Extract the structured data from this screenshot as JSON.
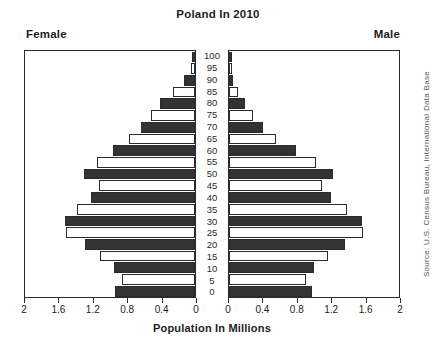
{
  "chart_data": {
    "type": "bar",
    "title": "Poland In 2010",
    "subtitle": "",
    "xlabel": "Population In Millions",
    "ylabel": "",
    "left_panel_label": "Female",
    "right_panel_label": "Male",
    "source": "Source: U.S. Census Bureau, International Data Base",
    "grid": false,
    "legend": "none",
    "xlim_left": [
      2,
      0
    ],
    "xlim_right": [
      0,
      2
    ],
    "xticks_left": [
      "2",
      "1.6",
      "1.2",
      "0.8",
      "0.4",
      "0"
    ],
    "xticks_right": [
      "0",
      "0.4",
      "0.8",
      "1.2",
      "1.6",
      "2"
    ],
    "xtick_values": [
      0,
      0.4,
      0.8,
      1.2,
      1.6,
      2
    ],
    "categories": [
      "100",
      "95",
      "90",
      "85",
      "80",
      "75",
      "70",
      "65",
      "60",
      "55",
      "50",
      "45",
      "40",
      "35",
      "30",
      "25",
      "20",
      "15",
      "10",
      "5",
      "0"
    ],
    "series": [
      {
        "name": "Female",
        "side": "left",
        "values": [
          0.01,
          0.05,
          0.13,
          0.26,
          0.41,
          0.52,
          0.64,
          0.78,
          0.97,
          1.15,
          1.31,
          1.13,
          1.22,
          1.39,
          1.53,
          1.52,
          1.3,
          1.12,
          0.95,
          0.86,
          0.94
        ]
      },
      {
        "name": "Male",
        "side": "right",
        "values": [
          0.01,
          0.02,
          0.05,
          0.11,
          0.19,
          0.28,
          0.4,
          0.55,
          0.79,
          1.02,
          1.22,
          1.09,
          1.2,
          1.39,
          1.56,
          1.58,
          1.36,
          1.17,
          1.0,
          0.9,
          0.98
        ]
      }
    ],
    "bar_styles": [
      "filled",
      "hollow",
      "filled",
      "hollow",
      "filled",
      "hollow",
      "filled",
      "hollow",
      "filled",
      "hollow",
      "filled",
      "hollow",
      "filled",
      "hollow",
      "filled",
      "hollow",
      "filled",
      "hollow",
      "filled",
      "hollow",
      "filled"
    ],
    "colors": {
      "filled": "#333333",
      "hollow": "#ffffff",
      "outline": "#2b2b2b",
      "background": "#ffffff",
      "text": "#1d1d1d"
    }
  }
}
